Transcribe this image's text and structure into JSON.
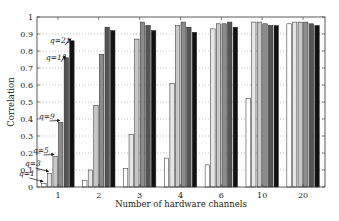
{
  "chart_data": {
    "type": "bar",
    "title": "",
    "xlabel": "Number of hardware channels",
    "ylabel": "Correlation",
    "ylim": [
      0,
      1
    ],
    "yticks": [
      0,
      0.1,
      0.2,
      0.3,
      0.4,
      0.5,
      0.6,
      0.7,
      0.8,
      0.9,
      1
    ],
    "ytick_labels": [
      "0",
      "0.1",
      "0.2",
      "0.3",
      "0.4",
      "0.5",
      "0.6",
      "0.7",
      "0.8",
      "0.9",
      "1"
    ],
    "grid": "horizontal dotted",
    "legend": "none (inline annotations on first group)",
    "categories": [
      "1",
      "2",
      "3",
      "4",
      "6",
      "10",
      "20"
    ],
    "series": [
      {
        "name": "q=1",
        "color": "#ffffff",
        "values": [
          0.02,
          0.04,
          0.11,
          0.17,
          0.13,
          0.52,
          0.96
        ]
      },
      {
        "name": "q=3",
        "color": "#e6e6e6",
        "values": [
          0.08,
          0.1,
          0.31,
          0.61,
          0.93,
          0.97,
          0.97
        ]
      },
      {
        "name": "q=5",
        "color": "#c8c8c8",
        "values": [
          0.18,
          0.48,
          0.87,
          0.95,
          0.96,
          0.97,
          0.97
        ]
      },
      {
        "name": "q=9",
        "color": "#8c8c8c",
        "values": [
          0.38,
          0.78,
          0.97,
          0.97,
          0.96,
          0.96,
          0.97
        ]
      },
      {
        "name": "q=15",
        "color": "#555555",
        "values": [
          0.76,
          0.94,
          0.95,
          0.94,
          0.97,
          0.95,
          0.96
        ]
      },
      {
        "name": "q=21",
        "color": "#111111",
        "values": [
          0.86,
          0.92,
          0.92,
          0.91,
          0.94,
          0.95,
          0.95
        ]
      }
    ],
    "annotations": [
      {
        "text": "q=1",
        "series": 0,
        "category": "1"
      },
      {
        "text": "q=3",
        "series": 1,
        "category": "1"
      },
      {
        "text": "q=5",
        "series": 2,
        "category": "1"
      },
      {
        "text": "q=9",
        "series": 3,
        "category": "1"
      },
      {
        "text": "q=15",
        "series": 4,
        "category": "1"
      },
      {
        "text": "q=21",
        "series": 5,
        "category": "1"
      }
    ]
  }
}
